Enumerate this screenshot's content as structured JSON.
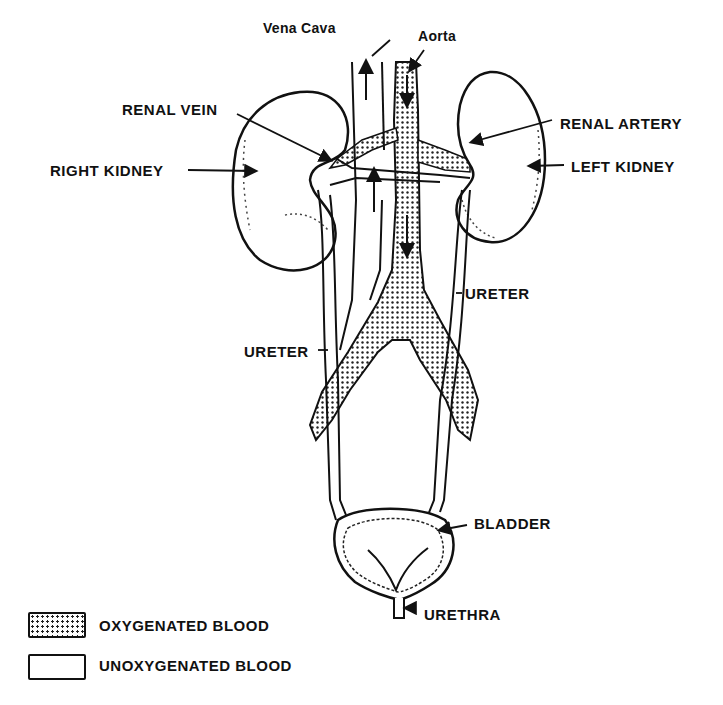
{
  "diagram": {
    "title": "",
    "labels": {
      "vena_cava": "Vena Cava",
      "aorta": "Aorta",
      "renal_vein": "RENAL VEIN",
      "renal_artery": "RENAL ARTERY",
      "right_kidney": "RIGHT KIDNEY",
      "left_kidney": "LEFT KIDNEY",
      "ureter_right": "URETER",
      "ureter_left": "URETER",
      "bladder": "BLADDER",
      "urethra": "URETHRA"
    },
    "legend": [
      {
        "pattern": "dotted",
        "label": "OXYGENATED BLOOD"
      },
      {
        "pattern": "blank",
        "label": "UNOXYGENATED BLOOD"
      }
    ],
    "colors": {
      "ink": "#111111",
      "background": "#ffffff"
    }
  }
}
